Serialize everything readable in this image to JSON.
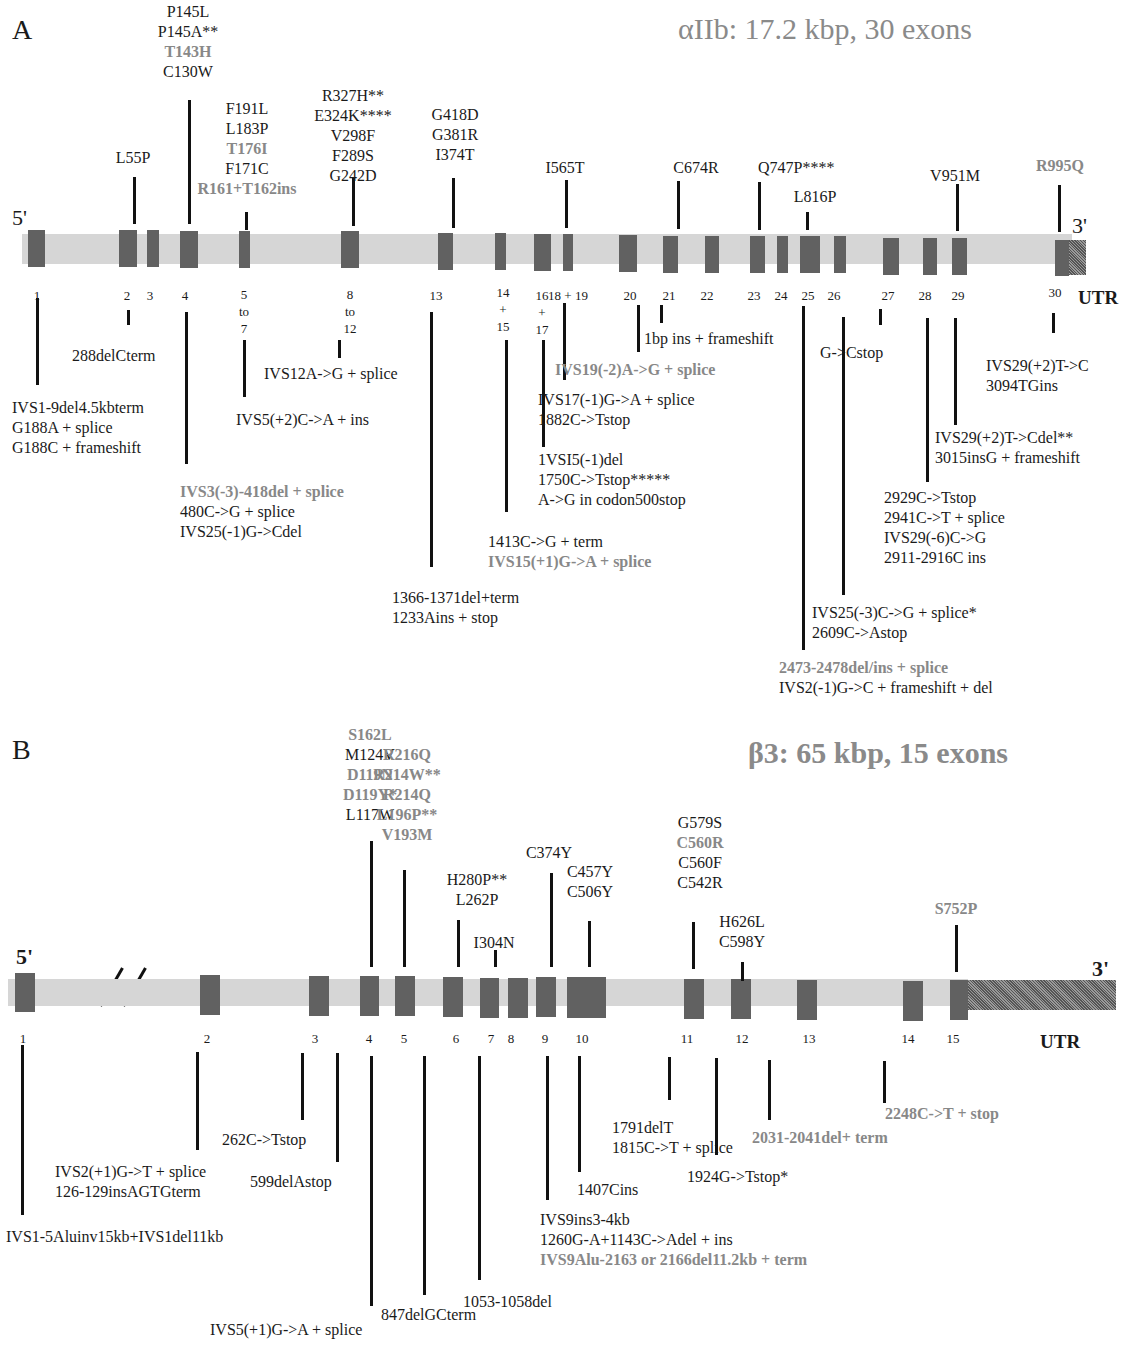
{
  "panel_a": {
    "letter": "A",
    "title": "αIIb: 17.2 kbp, 30 exons",
    "five_prime": "5'",
    "three_prime": "3'",
    "utr": "UTR",
    "exon_labels": [
      {
        "text": "1"
      },
      {
        "text": "2"
      },
      {
        "text": "3"
      },
      {
        "text": "4"
      },
      {
        "text": "5\nto\n7"
      },
      {
        "text": "8\nto\n12"
      },
      {
        "text": "13"
      },
      {
        "text": "14\n+\n15"
      },
      {
        "text": "16\n+\n17"
      },
      {
        "text": "18 + 19"
      },
      {
        "text": "20"
      },
      {
        "text": "21"
      },
      {
        "text": "22"
      },
      {
        "text": "23"
      },
      {
        "text": "24"
      },
      {
        "text": "25"
      },
      {
        "text": "26"
      },
      {
        "text": "27"
      },
      {
        "text": "28"
      },
      {
        "text": "29"
      },
      {
        "text": "30"
      }
    ],
    "missense_mutations": [
      {
        "exon": "2",
        "lines": [
          {
            "t": "L55P"
          }
        ]
      },
      {
        "exon": "4",
        "lines": [
          {
            "t": "P145L"
          },
          {
            "t": "P145A**"
          },
          {
            "t": "T143H",
            "grey": true
          },
          {
            "t": "C130W"
          }
        ]
      },
      {
        "exon": "5-7",
        "lines": [
          {
            "t": "F191L"
          },
          {
            "t": "L183P"
          },
          {
            "t": "T176I",
            "grey": true
          },
          {
            "t": "F171C"
          },
          {
            "t": "R161+T162ins",
            "grey": true
          }
        ]
      },
      {
        "exon": "8-12",
        "lines": [
          {
            "t": "R327H**"
          },
          {
            "t": "E324K****"
          },
          {
            "t": "V298F"
          },
          {
            "t": "F289S"
          },
          {
            "t": "G242D"
          }
        ]
      },
      {
        "exon": "13",
        "lines": [
          {
            "t": "G418D"
          },
          {
            "t": "G381R"
          },
          {
            "t": "I374T"
          }
        ]
      },
      {
        "exon": "18",
        "lines": [
          {
            "t": "I565T"
          }
        ]
      },
      {
        "exon": "21",
        "lines": [
          {
            "t": "C674R"
          }
        ]
      },
      {
        "exon": "23",
        "lines": [
          {
            "t": "Q747P****"
          }
        ]
      },
      {
        "exon": "25",
        "lines": [
          {
            "t": "L816P"
          }
        ]
      },
      {
        "exon": "29",
        "lines": [
          {
            "t": "V951M"
          }
        ]
      },
      {
        "exon": "30",
        "lines": [
          {
            "t": "R995Q",
            "grey": true
          }
        ]
      }
    ],
    "other_mutations": [
      {
        "exon": "1",
        "lines": [
          {
            "t": "IVS1-9del4.5kbterm"
          },
          {
            "t": "G188A + splice"
          },
          {
            "t": "G188C + frameshift"
          }
        ]
      },
      {
        "exon": "2",
        "lines": [
          {
            "t": "288delCterm"
          }
        ]
      },
      {
        "exon": "4",
        "lines": [
          {
            "t": "IVS3(-3)-418del + splice",
            "grey": true
          },
          {
            "t": "480C->G + splice"
          },
          {
            "t": "IVS25(-1)G->Cdel"
          }
        ]
      },
      {
        "exon": "5-7",
        "lines": [
          {
            "t": "IVS5(+2)C->A + ins"
          }
        ]
      },
      {
        "exon": "8-12",
        "lines": [
          {
            "t": "IVS12A->G + splice"
          }
        ]
      },
      {
        "exon": "13",
        "lines": [
          {
            "t": "1366-1371del+term"
          },
          {
            "t": "1233Ains + stop"
          }
        ]
      },
      {
        "exon": "14+15",
        "lines": [
          {
            "t": "1413C->G + term"
          },
          {
            "t": "IVS15(+1)G->A + splice",
            "grey": true
          }
        ]
      },
      {
        "exon": "16+17",
        "lines": [
          {
            "t": "1VSI5(-1)del"
          },
          {
            "t": "1750C->Tstop*****"
          },
          {
            "t": "A->G in codon500stop"
          }
        ]
      },
      {
        "exon": "18+19",
        "lines": [
          {
            "t": "IVS17(-1)G->A + splice"
          },
          {
            "t": "1882C->Tstop"
          }
        ]
      },
      {
        "exon": "20",
        "lines": [
          {
            "t": "IVS19(-2)A->G + splice",
            "grey": true
          }
        ]
      },
      {
        "exon": "21",
        "lines": [
          {
            "t": "1bp ins + frameshift"
          }
        ]
      },
      {
        "exon": "25",
        "lines": [
          {
            "t": "2473-2478del/ins + splice",
            "grey": true
          },
          {
            "t": "IVS2(-1)G->C + frameshift + del"
          }
        ]
      },
      {
        "exon": "26",
        "lines": [
          {
            "t": "IVS25(-3)C->G + splice*"
          },
          {
            "t": "2609C->Astop"
          }
        ]
      },
      {
        "exon": "27",
        "lines": [
          {
            "t": "G->Cstop"
          }
        ]
      },
      {
        "exon": "28",
        "lines": [
          {
            "t": "2929C->Tstop"
          },
          {
            "t": "2941C->T + splice"
          },
          {
            "t": "IVS29(-6)C->G"
          },
          {
            "t": "2911-2916C ins"
          }
        ]
      },
      {
        "exon": "29",
        "lines": [
          {
            "t": "IVS29(+2)T->Cdel**"
          },
          {
            "t": "3015insG + frameshift"
          }
        ]
      },
      {
        "exon": "30",
        "lines": [
          {
            "t": "IVS29(+2)T->C"
          },
          {
            "t": "3094TGins"
          }
        ]
      }
    ]
  },
  "panel_b": {
    "letter": "B",
    "title": "β3:  65 kbp, 15 exons",
    "five_prime": "5'",
    "three_prime": "3'",
    "utr": "UTR",
    "exon_labels": [
      {
        "text": "1"
      },
      {
        "text": "2"
      },
      {
        "text": "3"
      },
      {
        "text": "4"
      },
      {
        "text": "5"
      },
      {
        "text": "6"
      },
      {
        "text": "7"
      },
      {
        "text": "8"
      },
      {
        "text": "9"
      },
      {
        "text": "10"
      },
      {
        "text": "11"
      },
      {
        "text": "12"
      },
      {
        "text": "13"
      },
      {
        "text": "14"
      },
      {
        "text": "15"
      }
    ],
    "missense_mutations": [
      {
        "exon": "4",
        "lines": [
          {
            "t": "S162L",
            "grey": true
          },
          {
            "t": "M124V"
          },
          {
            "t": "D119N",
            "grey": true
          },
          {
            "t": "D119Y*",
            "grey": true
          },
          {
            "t": "L117W"
          }
        ]
      },
      {
        "exon": "5",
        "lines": [
          {
            "t": "R216Q",
            "grey": true
          },
          {
            "t": "R214W**",
            "grey": true
          },
          {
            "t": "R214Q",
            "grey": true
          },
          {
            "t": "L196P**",
            "grey": true
          },
          {
            "t": "V193M",
            "grey": true
          }
        ]
      },
      {
        "exon": "6",
        "lines": [
          {
            "t": "H280P**"
          },
          {
            "t": "L262P"
          }
        ]
      },
      {
        "exon": "7",
        "lines": [
          {
            "t": "I304N"
          }
        ]
      },
      {
        "exon": "9",
        "lines": [
          {
            "t": "C374Y"
          }
        ]
      },
      {
        "exon": "10",
        "lines": [
          {
            "t": "C457Y"
          },
          {
            "t": "C506Y"
          }
        ]
      },
      {
        "exon": "11",
        "lines": [
          {
            "t": "G579S"
          },
          {
            "t": "C560R",
            "grey": true
          },
          {
            "t": "C560F"
          },
          {
            "t": "C542R"
          }
        ]
      },
      {
        "exon": "12",
        "lines": [
          {
            "t": "H626L"
          },
          {
            "t": "C598Y"
          }
        ]
      },
      {
        "exon": "15",
        "lines": [
          {
            "t": "S752P",
            "grey": true
          }
        ]
      }
    ],
    "other_mutations": [
      {
        "exon": "1",
        "lines": [
          {
            "t": "IVS1-5Aluinv15kb+IVS1del11kb"
          }
        ]
      },
      {
        "exon": "2",
        "lines": [
          {
            "t": "IVS2(+1)G->T + splice"
          },
          {
            "t": "126-129insAGTGterm"
          }
        ]
      },
      {
        "exon": "3",
        "lines": [
          {
            "t": "262C->Tstop"
          }
        ]
      },
      {
        "exon": "4",
        "lines": [
          {
            "t": "599delAstop"
          }
        ]
      },
      {
        "exon": "5",
        "lines": [
          {
            "t": "IVS5(+1)G->A + splice"
          }
        ]
      },
      {
        "exon": "6",
        "lines": [
          {
            "t": "847delGCterm"
          }
        ]
      },
      {
        "exon": "8",
        "lines": [
          {
            "t": "1053-1058del"
          }
        ]
      },
      {
        "exon": "9",
        "lines": [
          {
            "t": "IVS9ins3-4kb"
          },
          {
            "t": "1260G-A+1143C->Adel + ins"
          },
          {
            "t": "IVS9Alu-2163 or 2166del11.2kb + term",
            "grey": true
          }
        ]
      },
      {
        "exon": "10",
        "lines": [
          {
            "t": "1407Cins"
          }
        ]
      },
      {
        "exon": "11",
        "lines": [
          {
            "t": "1791delT"
          },
          {
            "t": "1815C->T + splice"
          }
        ]
      },
      {
        "exon": "12",
        "lines": [
          {
            "t": "1924G->Tstop*"
          }
        ]
      },
      {
        "exon": "13",
        "lines": [
          {
            "t": "2031-2041del+ term",
            "grey": true
          }
        ]
      },
      {
        "exon": "15",
        "lines": [
          {
            "t": "2248C->T + stop",
            "grey": true
          }
        ]
      }
    ]
  }
}
